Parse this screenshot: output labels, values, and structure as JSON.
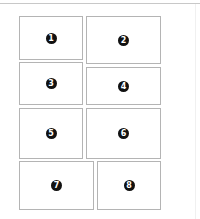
{
  "layout": {
    "panels": [
      {
        "number": "1",
        "x": 19,
        "y": 16,
        "w": 64,
        "h": 44
      },
      {
        "number": "2",
        "x": 86,
        "y": 16,
        "w": 75,
        "h": 48
      },
      {
        "number": "3",
        "x": 19,
        "y": 62,
        "w": 64,
        "h": 43
      },
      {
        "number": "4",
        "x": 86,
        "y": 67,
        "w": 75,
        "h": 38
      },
      {
        "number": "5",
        "x": 19,
        "y": 108,
        "w": 64,
        "h": 51
      },
      {
        "number": "6",
        "x": 86,
        "y": 108,
        "w": 75,
        "h": 51
      },
      {
        "number": "7",
        "x": 19,
        "y": 161,
        "w": 75,
        "h": 49
      },
      {
        "number": "8",
        "x": 97,
        "y": 161,
        "w": 64,
        "h": 49
      }
    ]
  },
  "colors": {
    "border": "#b4b4b4",
    "badge": "#111111",
    "badge_text": "#ffffff"
  }
}
